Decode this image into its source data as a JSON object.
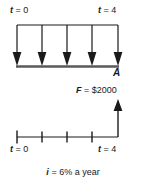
{
  "diagram": {
    "type": "cash-flow-diagram",
    "colors": {
      "ink": "#1a1a1a",
      "baseline": "#555555",
      "background": "#ffffff"
    },
    "upper_timeline": {
      "start_label": "t = 0",
      "end_label": "t = 4",
      "start_var": "t",
      "start_value": "= 0",
      "end_var": "t",
      "end_value": "= 4",
      "series_label": "A",
      "arrow_count": 5,
      "arrow_direction": "down",
      "periods": 4
    },
    "lower_timeline": {
      "start_label": "t = 0",
      "end_label": "t = 4",
      "start_var": "t",
      "start_value": "= 0",
      "end_var": "t",
      "end_value": "= 4",
      "tick_count": 4,
      "arrow_direction": "up",
      "future_value_var": "F",
      "future_value_text": "= $2000",
      "future_value_label": "F = $2000"
    },
    "caption": {
      "var": "i",
      "text": "= 6% a year",
      "full": "i = 6% a year"
    }
  }
}
